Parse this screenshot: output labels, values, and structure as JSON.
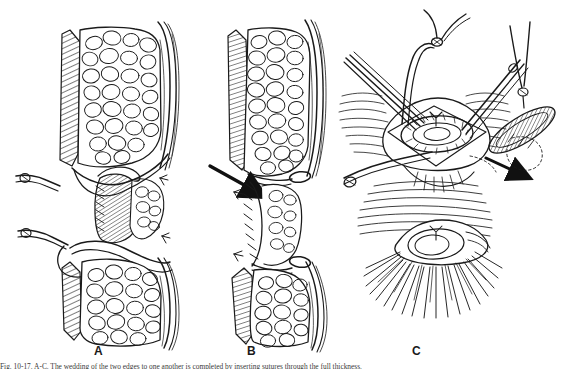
{
  "figure": {
    "background_color": "#ffffff",
    "ink_color": "#1a1a1a",
    "panels": [
      {
        "letter": "A",
        "name": "panel-a",
        "description": "Sagittal view of an abdominal wall wound with upper and lower subcutaneous fat flaps, hatched fascial edges and interrupted retention sutures passing through the deep layers"
      },
      {
        "letter": "B",
        "name": "panel-b",
        "description": "Sagittal view after the sutures are tied, showing the fat flaps approximated and the closure line narrowed; a bold arrow indicates the constricted segment"
      },
      {
        "letter": "C",
        "name": "panel-c",
        "description": "Surface views of the operative field: above, the wound held open by forceps and traction sutures with an inset detail of the hatched elliptical excision; below, the completed closure with radiating skin tension lines"
      }
    ],
    "annotations": {
      "arrow_b_label": "arrow-indicating-constriction",
      "arrow_c_label": "arrow-to-inset-detail"
    },
    "caption": "Fig. 10-17. A-C. The wedding of the two edges to one another is completed by inserting sutures through the full thickness."
  }
}
